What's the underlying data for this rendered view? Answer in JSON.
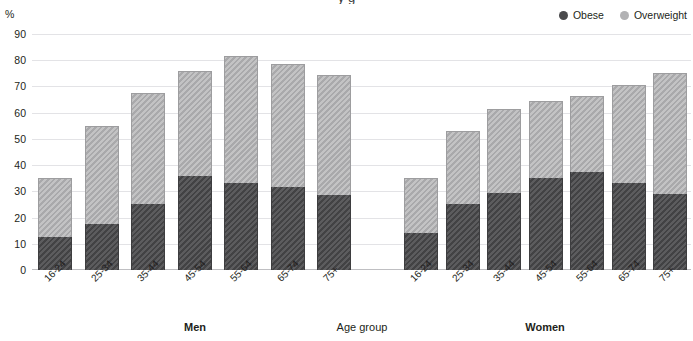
{
  "title_cropped": "y g",
  "legend": {
    "items": [
      {
        "label": "Obese",
        "color": "#4a4a4c",
        "icon": "filled-circle-icon"
      },
      {
        "label": "Overweight",
        "color": "#b2b2b4",
        "icon": "filled-circle-icon"
      }
    ]
  },
  "captions": {
    "men": "Men",
    "women": "Women",
    "axis": "Age group"
  },
  "chart_data": {
    "type": "bar",
    "subtype": "stacked-bar",
    "title": "",
    "xlabel": "Age group",
    "ylabel": "%",
    "ylim": [
      0,
      90
    ],
    "yticks": [
      0,
      10,
      20,
      30,
      40,
      50,
      60,
      70,
      80,
      90
    ],
    "ytick_labels": [
      "0",
      "10",
      "20",
      "30",
      "40",
      "50",
      "60",
      "70",
      "80",
      "90"
    ],
    "grid": true,
    "legend_position": "top-right",
    "categories": [
      "16-24",
      "25-34",
      "35-44",
      "45-54",
      "55-64",
      "65-74",
      "75+"
    ],
    "groups": [
      {
        "name": "Men",
        "series": [
          {
            "name": "Obese",
            "color": "#4a4a4c",
            "values": [
              12.5,
              17.5,
              25.0,
              36.0,
              33.0,
              31.5,
              28.5
            ]
          },
          {
            "name": "Overweight",
            "color": "#b2b2b4",
            "values": [
              22.5,
              37.5,
              42.5,
              40.0,
              48.5,
              47.0,
              46.0
            ]
          }
        ],
        "totals": [
          35.0,
          55.0,
          67.5,
          76.0,
          81.5,
          78.5,
          74.5
        ]
      },
      {
        "name": "Women",
        "series": [
          {
            "name": "Obese",
            "color": "#4a4a4c",
            "values": [
              14.0,
              25.0,
              29.5,
              35.0,
              37.5,
              33.0,
              29.0
            ]
          },
          {
            "name": "Overweight",
            "color": "#b2b2b4",
            "values": [
              21.0,
              28.0,
              32.0,
              29.5,
              29.0,
              37.5,
              46.0
            ]
          }
        ],
        "totals": [
          35.0,
          53.0,
          61.5,
          64.5,
          66.5,
          70.5,
          75.0
        ]
      }
    ]
  }
}
